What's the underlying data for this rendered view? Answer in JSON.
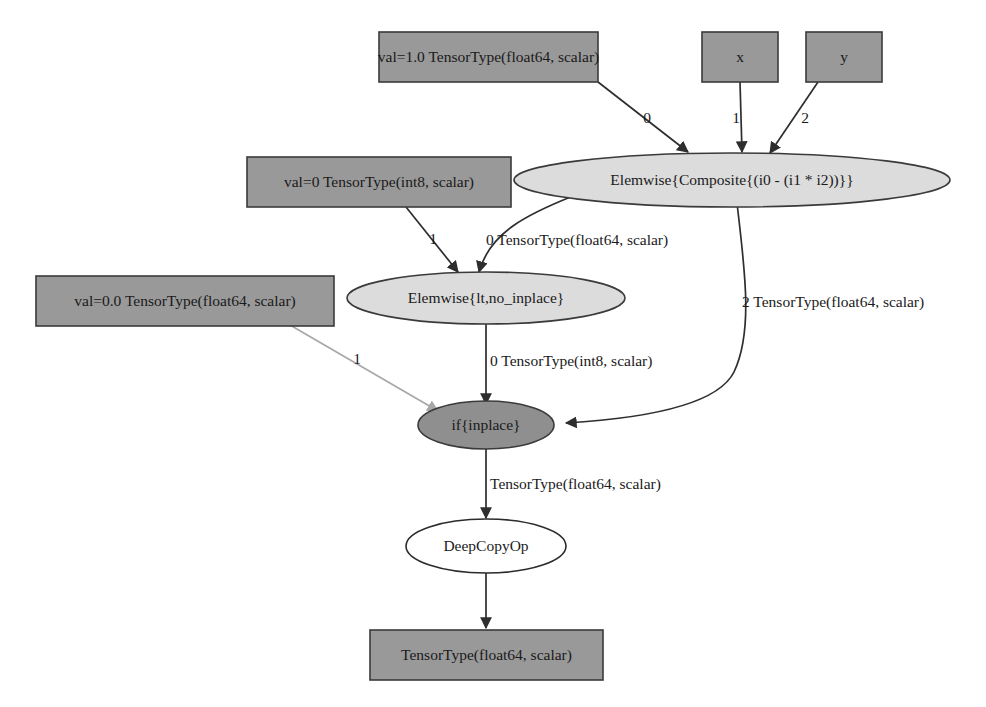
{
  "diagram": {
    "background_color": "#ffffff",
    "colors": {
      "box_fill": "#999999",
      "ellipse_light_fill": "#dcdcdc",
      "ellipse_dark_fill": "#8f8f8f",
      "ellipse_white_fill": "#ffffff",
      "stroke": "#2e2e2e",
      "faint_stroke": "#a8a8a8",
      "text": "#1a1a1a"
    }
  },
  "nodes": {
    "const_one": {
      "label": "val=1.0 TensorType(float64, scalar)",
      "shape": "box",
      "fill": "#999999"
    },
    "input_x": {
      "label": "x",
      "shape": "box",
      "fill": "#999999"
    },
    "input_y": {
      "label": "y",
      "shape": "box",
      "fill": "#999999"
    },
    "const_int8_zero": {
      "label": "val=0 TensorType(int8, scalar)",
      "shape": "box",
      "fill": "#999999"
    },
    "const_float_zero": {
      "label": "val=0.0 TensorType(float64, scalar)",
      "shape": "box",
      "fill": "#999999"
    },
    "composite": {
      "label": "Elemwise{Composite{(i0 - (i1 * i2))}}",
      "shape": "ellipse",
      "fill": "#dcdcdc"
    },
    "lt_no_inplace": {
      "label": "Elemwise{lt,no_inplace}",
      "shape": "ellipse",
      "fill": "#dcdcdc"
    },
    "if_inplace": {
      "label": "if{inplace}",
      "shape": "ellipse",
      "fill": "#8f8f8f"
    },
    "deep_copy_op": {
      "label": "DeepCopyOp",
      "shape": "ellipse",
      "fill": "#ffffff"
    },
    "output_tensor": {
      "label": "TensorType(float64, scalar)",
      "shape": "box",
      "fill": "#999999"
    }
  },
  "edges": {
    "const_one_to_composite": {
      "label": "0",
      "from": "const_one",
      "to": "composite"
    },
    "x_to_composite": {
      "label": "1",
      "from": "input_x",
      "to": "composite"
    },
    "y_to_composite": {
      "label": "2",
      "from": "input_y",
      "to": "composite"
    },
    "int8_to_lt": {
      "label": "1",
      "from": "const_int8_zero",
      "to": "lt_no_inplace"
    },
    "composite_to_lt": {
      "label": "0 TensorType(float64, scalar)",
      "from": "composite",
      "to": "lt_no_inplace"
    },
    "composite_to_if": {
      "label": "2 TensorType(float64, scalar)",
      "from": "composite",
      "to": "if_inplace"
    },
    "lt_to_if": {
      "label": "0 TensorType(int8, scalar)",
      "from": "lt_no_inplace",
      "to": "if_inplace"
    },
    "float_zero_to_if": {
      "label": "1",
      "from": "const_float_zero",
      "to": "if_inplace"
    },
    "if_to_deepcopy": {
      "label": "TensorType(float64, scalar)",
      "from": "if_inplace",
      "to": "deep_copy_op"
    },
    "deepcopy_to_output": {
      "label": "",
      "from": "deep_copy_op",
      "to": "output_tensor"
    }
  }
}
